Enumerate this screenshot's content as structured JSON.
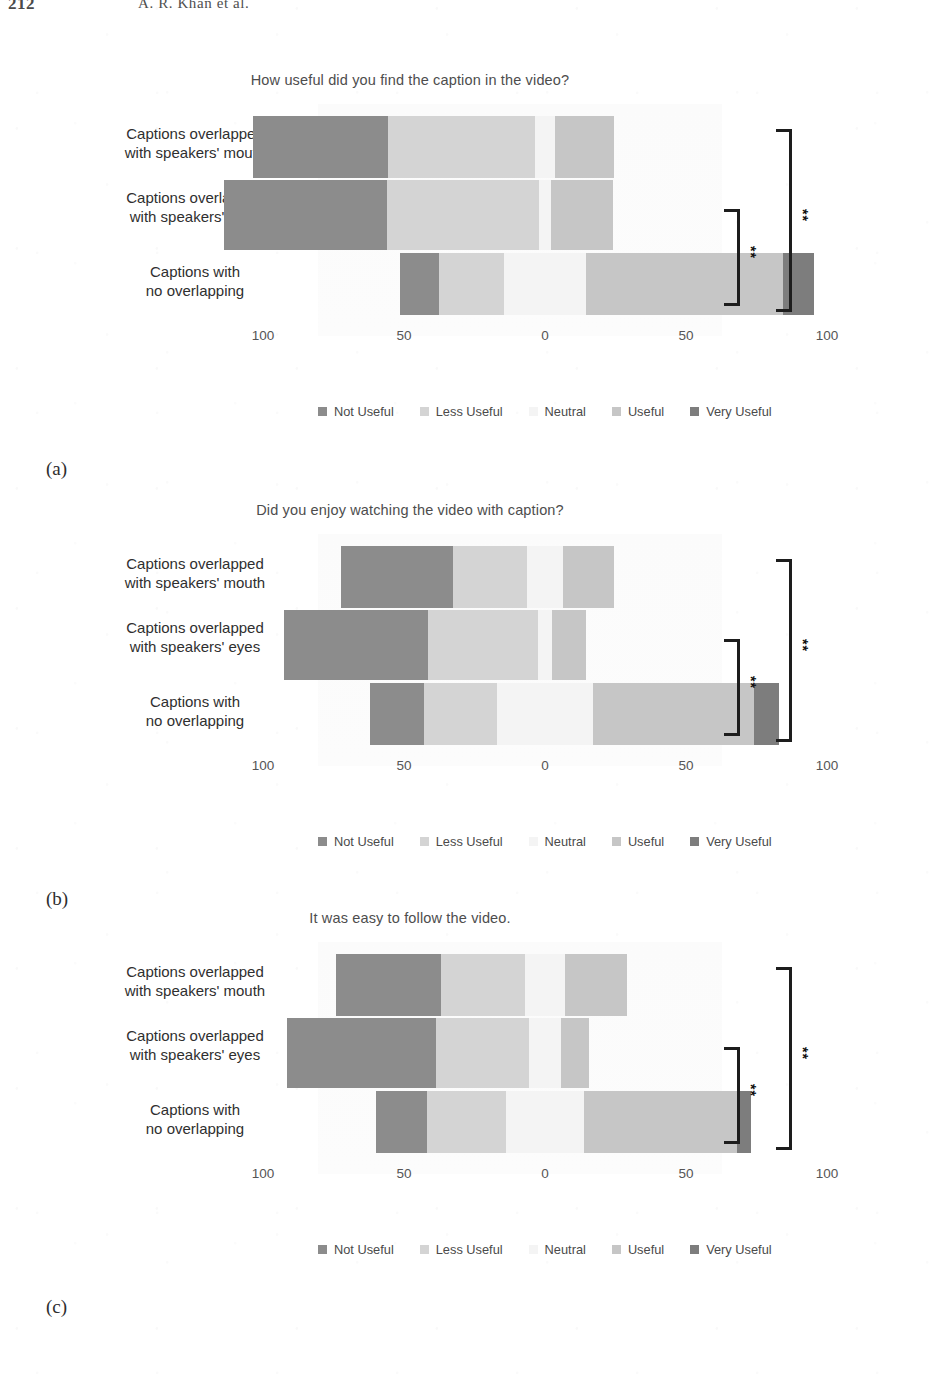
{
  "running_head": {
    "folio": "212",
    "authors": "A. R. Khan et al."
  },
  "legend": {
    "items": [
      {
        "label": "Not Useful",
        "color": "#8c8c8c"
      },
      {
        "label": "Less Useful",
        "color": "#d4d4d4"
      },
      {
        "label": "Neutral",
        "color": "#f4f4f4"
      },
      {
        "label": "Useful",
        "color": "#c6c6c6"
      },
      {
        "label": "Very Useful",
        "color": "#7d7d7d"
      }
    ]
  },
  "axis": {
    "ticks": [
      "100",
      "50",
      "0",
      "50",
      "100"
    ],
    "tick_values": [
      -100,
      -50,
      0,
      50,
      100
    ]
  },
  "categories": [
    "Captions overlapped\nwith speakers'  mouth",
    "Captions overlapped\nwith speakers'  eyes",
    "Captions with\nno overlapping"
  ],
  "panels": [
    {
      "label": "(a)",
      "title": "How useful did you find the caption in the video?"
    },
    {
      "label": "(b)",
      "title": "Did you enjoy watching the video with caption?"
    },
    {
      "label": "(c)",
      "title": "It was easy to follow the video."
    }
  ],
  "annotations": {
    "significance": "**",
    "inner_pair": "Captions overlapped with speakers' eyes vs Captions with no overlapping",
    "outer_pair": "Captions overlapped with speakers' mouth vs Captions with no overlapping"
  },
  "chart_data": [
    {
      "type": "bar",
      "subtype": "diverging-stacked-likert",
      "title": "How useful did you find the caption in the video?",
      "panel": "(a)",
      "xlabel": "",
      "ylabel": "",
      "xlim": [
        -100,
        100
      ],
      "xticks": [
        -100,
        -50,
        0,
        50,
        100
      ],
      "xticklabels": [
        "100",
        "50",
        "0",
        "50",
        "100"
      ],
      "grid": false,
      "legend_position": "bottom",
      "categories": [
        "Captions overlapped with speakers'  mouth",
        "Captions overlapped with speakers'  eyes",
        "Captions with no overlapping"
      ],
      "series": [
        {
          "name": "Not Useful",
          "color": "#8c8c8c",
          "values": [
            48,
            58,
            14
          ]
        },
        {
          "name": "Less Useful",
          "color": "#d4d4d4",
          "values": [
            52,
            54,
            23
          ]
        },
        {
          "name": "Neutral",
          "color": "#f4f4f4",
          "values": [
            7,
            4,
            29
          ]
        },
        {
          "name": "Useful",
          "color": "#c6c6c6",
          "values": [
            21,
            22,
            70
          ]
        },
        {
          "name": "Very Useful",
          "color": "#7d7d7d",
          "values": [
            0,
            0,
            11
          ]
        }
      ],
      "negative_side_label": "unfavourable (Not Useful + Less Useful)",
      "positive_side_label": "favourable (Useful + Very Useful)",
      "significance_marks": [
        {
          "pair": [
            "Captions overlapped with speakers'  eyes",
            "Captions with no overlapping"
          ],
          "mark": "**"
        },
        {
          "pair": [
            "Captions overlapped with speakers'  mouth",
            "Captions with no overlapping"
          ],
          "mark": "**"
        }
      ]
    },
    {
      "type": "bar",
      "subtype": "diverging-stacked-likert",
      "title": "Did you enjoy watching the video with caption?",
      "panel": "(b)",
      "xlabel": "",
      "ylabel": "",
      "xlim": [
        -100,
        100
      ],
      "xticks": [
        -100,
        -50,
        0,
        50,
        100
      ],
      "xticklabels": [
        "100",
        "50",
        "0",
        "50",
        "100"
      ],
      "grid": false,
      "legend_position": "bottom",
      "categories": [
        "Captions overlapped with speakers'  mouth",
        "Captions overlapped with speakers'  eyes",
        "Captions with no overlapping"
      ],
      "series": [
        {
          "name": "Not Useful",
          "color": "#8c8c8c",
          "values": [
            40,
            51,
            19
          ]
        },
        {
          "name": "Less Useful",
          "color": "#d4d4d4",
          "values": [
            26,
            39,
            26
          ]
        },
        {
          "name": "Neutral",
          "color": "#f4f4f4",
          "values": [
            13,
            5,
            34
          ]
        },
        {
          "name": "Useful",
          "color": "#c6c6c6",
          "values": [
            18,
            12,
            57
          ]
        },
        {
          "name": "Very Useful",
          "color": "#7d7d7d",
          "values": [
            0,
            0,
            9
          ]
        }
      ],
      "significance_marks": [
        {
          "pair": [
            "Captions overlapped with speakers'  eyes",
            "Captions with no overlapping"
          ],
          "mark": "**"
        },
        {
          "pair": [
            "Captions overlapped with speakers'  mouth",
            "Captions with no overlapping"
          ],
          "mark": "**"
        }
      ]
    },
    {
      "type": "bar",
      "subtype": "diverging-stacked-likert",
      "title": "It was easy to follow the video.",
      "panel": "(c)",
      "xlabel": "",
      "ylabel": "",
      "xlim": [
        -100,
        100
      ],
      "xticks": [
        -100,
        -50,
        0,
        50,
        100
      ],
      "xticklabels": [
        "100",
        "50",
        "0",
        "50",
        "100"
      ],
      "grid": false,
      "legend_position": "bottom",
      "categories": [
        "Captions overlapped with speakers'  mouth",
        "Captions overlapped with speakers'  eyes",
        "Captions with no overlapping"
      ],
      "series": [
        {
          "name": "Not Useful",
          "color": "#8c8c8c",
          "values": [
            37,
            53,
            18
          ]
        },
        {
          "name": "Less Useful",
          "color": "#d4d4d4",
          "values": [
            30,
            33,
            28
          ]
        },
        {
          "name": "Neutral",
          "color": "#f4f4f4",
          "values": [
            14,
            11,
            28
          ]
        },
        {
          "name": "Useful",
          "color": "#c6c6c6",
          "values": [
            22,
            10,
            54
          ]
        },
        {
          "name": "Very Useful",
          "color": "#7d7d7d",
          "values": [
            0,
            0,
            5
          ]
        }
      ],
      "significance_marks": [
        {
          "pair": [
            "Captions overlapped with speakers'  eyes",
            "Captions with no overlapping"
          ],
          "mark": "**"
        },
        {
          "pair": [
            "Captions overlapped with speakers'  mouth",
            "Captions with no overlapping"
          ],
          "mark": "**"
        }
      ]
    }
  ]
}
